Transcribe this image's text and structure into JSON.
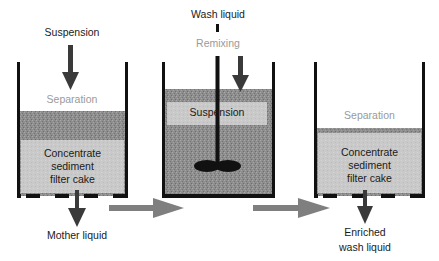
{
  "diagram": {
    "type": "process-flow",
    "title": "",
    "stages": [
      {
        "id": "stage-1",
        "input_label": "Suspension",
        "process_label": "Separation",
        "content_label": "Concentrate sediment filter cake",
        "content_lines": [
          "Concentrate",
          "sediment",
          "filter cake"
        ],
        "output_label": "Mother liquid"
      },
      {
        "id": "stage-2",
        "input_label": "Wash liquid",
        "process_label": "Remixing",
        "content_label": "Suspension"
      },
      {
        "id": "stage-3",
        "process_label": "Separation",
        "content_label": "Concentrate sediment filter cake",
        "content_lines": [
          "Concentrate",
          "sediment",
          "filter cake"
        ],
        "output_label": "Enriched wash liquid",
        "output_lines": [
          "Enriched",
          "wash liquid"
        ]
      }
    ],
    "transitions": [
      {
        "from": "stage-1",
        "to": "stage-2"
      },
      {
        "from": "stage-2",
        "to": "stage-3"
      }
    ],
    "colors": {
      "wall": "#111111",
      "liquid": "#8c8c8c",
      "cake": "#c8c8c8",
      "arrow_dark": "#3a3a3a",
      "arrow_grey": "#7f7f7f",
      "grey_label": "#9a9a9a"
    }
  }
}
